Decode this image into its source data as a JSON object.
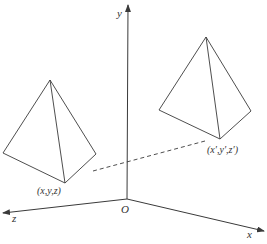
{
  "diagram": {
    "type": "3d-translation",
    "colors": {
      "line": "#3a3a3a",
      "text": "#333333",
      "background": "#ffffff"
    },
    "axes": {
      "origin_label": "O",
      "x_label": "x",
      "y_label": "y",
      "z_label": "z"
    },
    "points": {
      "original_label": "(x,y,z)",
      "transformed_label": "(x′,y′,z′)"
    },
    "shapes": [
      {
        "name": "original-tetrahedron",
        "vertices": {
          "apex": [
            50,
            80
          ],
          "left": [
            3,
            153
          ],
          "bottom": [
            65,
            183
          ],
          "right": [
            96,
            154
          ]
        }
      },
      {
        "name": "translated-tetrahedron",
        "vertices": {
          "apex": [
            206,
            37
          ],
          "left": [
            159,
            110
          ],
          "bottom": [
            220,
            139
          ],
          "right": [
            251,
            111
          ]
        }
      }
    ],
    "connector": {
      "style": "dashed",
      "from": [
        93,
        171
      ],
      "to": [
        205,
        141
      ]
    }
  }
}
